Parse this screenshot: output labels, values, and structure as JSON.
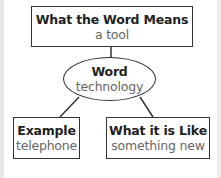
{
  "diagram": {
    "type": "word-map",
    "meaning": {
      "heading": "What the Word Means",
      "value": "a tool"
    },
    "center": {
      "heading": "Word",
      "value": "technology"
    },
    "example": {
      "heading": "Example",
      "value": "telephone"
    },
    "like": {
      "heading": "What it is Like",
      "value": "something new"
    },
    "colors": {
      "border": "#333333",
      "heading_text": "#222222",
      "value_text": "#666666",
      "background": "#ffffff"
    }
  }
}
